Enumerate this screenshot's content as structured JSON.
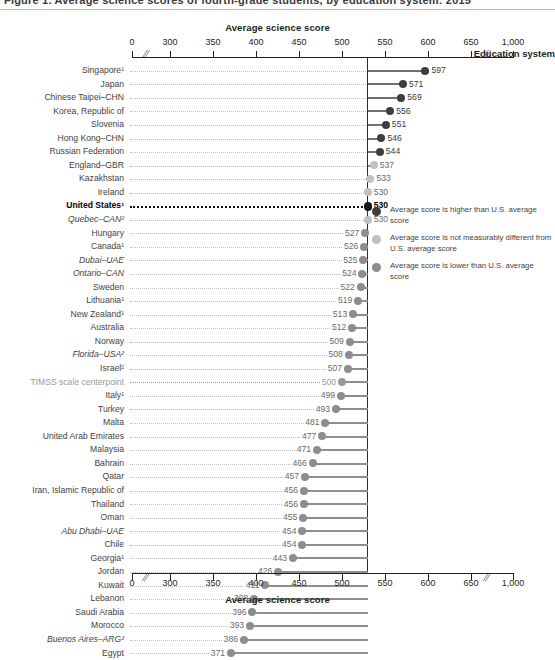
{
  "header": {
    "clipped_title": "Figure 1. Average science scores of fourth-grade students, by education system: 2015"
  },
  "axis": {
    "title": "Average science score",
    "ticks": [
      "0",
      "300",
      "350",
      "400",
      "450",
      "500",
      "550",
      "600",
      "650",
      "1,000"
    ],
    "tick_values": [
      0,
      300,
      350,
      400,
      450,
      500,
      550,
      600,
      650,
      1000
    ],
    "row_header": "Education system"
  },
  "legend": {
    "items": [
      {
        "key": "higher",
        "label": "Average score is higher than U.S. average score",
        "color": "#3d3d3d"
      },
      {
        "key": "same",
        "label": "Average score is not measurably different from U.S. average score",
        "color": "#c0c0c0"
      },
      {
        "key": "lower",
        "label": "Average score is lower than U.S. average score",
        "color": "#8d8d8d"
      }
    ]
  },
  "chart_data": {
    "type": "bar",
    "title": "Average science score",
    "xlabel": "Average science score",
    "ylabel": "Education system",
    "xlim": [
      260,
      680
    ],
    "grid": false,
    "legend_position": "right",
    "reference_line": {
      "label": "United States",
      "value": 530
    },
    "categories": [
      "Singapore¹",
      "Japan",
      "Chinese Taipei–CHN",
      "Korea, Republic of",
      "Slovenia",
      "Hong Kong–CHN",
      "Russian Federation",
      "England–GBR",
      "Kazakhstan",
      "Ireland",
      "United States¹",
      "Quebec–CAN²",
      "Hungary",
      "Canada¹",
      "Dubai–UAE",
      "Ontario–CAN",
      "Sweden",
      "Lithuania¹",
      "New Zealand¹",
      "Australia",
      "Norway",
      "Florida–USA²",
      "Israel²",
      "TIMSS scale centerpoint",
      "Italy¹",
      "Turkey",
      "Malta",
      "United Arab Emirates",
      "Malaysia",
      "Bahrain",
      "Qatar",
      "Iran, Islamic Republic of",
      "Thailand",
      "Oman",
      "Abu Dhabi–UAE",
      "Chile",
      "Georgia¹",
      "Jordan",
      "Kuwait",
      "Lebanon",
      "Saudi Arabia",
      "Morocco",
      "Buenos Aires–ARG²",
      "Egypt"
    ],
    "values": [
      597,
      571,
      569,
      556,
      551,
      546,
      544,
      537,
      533,
      530,
      530,
      530,
      527,
      526,
      525,
      524,
      522,
      519,
      513,
      512,
      509,
      508,
      507,
      500,
      499,
      493,
      481,
      477,
      471,
      466,
      457,
      456,
      456,
      455,
      454,
      454,
      443,
      426,
      411,
      398,
      396,
      393,
      386,
      371
    ],
    "comparison": [
      "higher",
      "higher",
      "higher",
      "higher",
      "higher",
      "higher",
      "higher",
      "same",
      "same",
      "same",
      "us",
      "same",
      "lower",
      "lower",
      "lower",
      "lower",
      "lower",
      "lower",
      "lower",
      "lower",
      "lower",
      "lower",
      "lower",
      "center",
      "lower",
      "lower",
      "lower",
      "lower",
      "lower",
      "lower",
      "lower",
      "lower",
      "lower",
      "lower",
      "lower",
      "lower",
      "lower",
      "lower",
      "lower",
      "lower",
      "lower",
      "lower",
      "lower",
      "lower"
    ],
    "italic_rows": [
      "Quebec–CAN²",
      "Dubai–UAE",
      "Ontario–CAN",
      "Florida–USA²",
      "Abu Dhabi–UAE",
      "Buenos Aires–ARG²"
    ]
  }
}
